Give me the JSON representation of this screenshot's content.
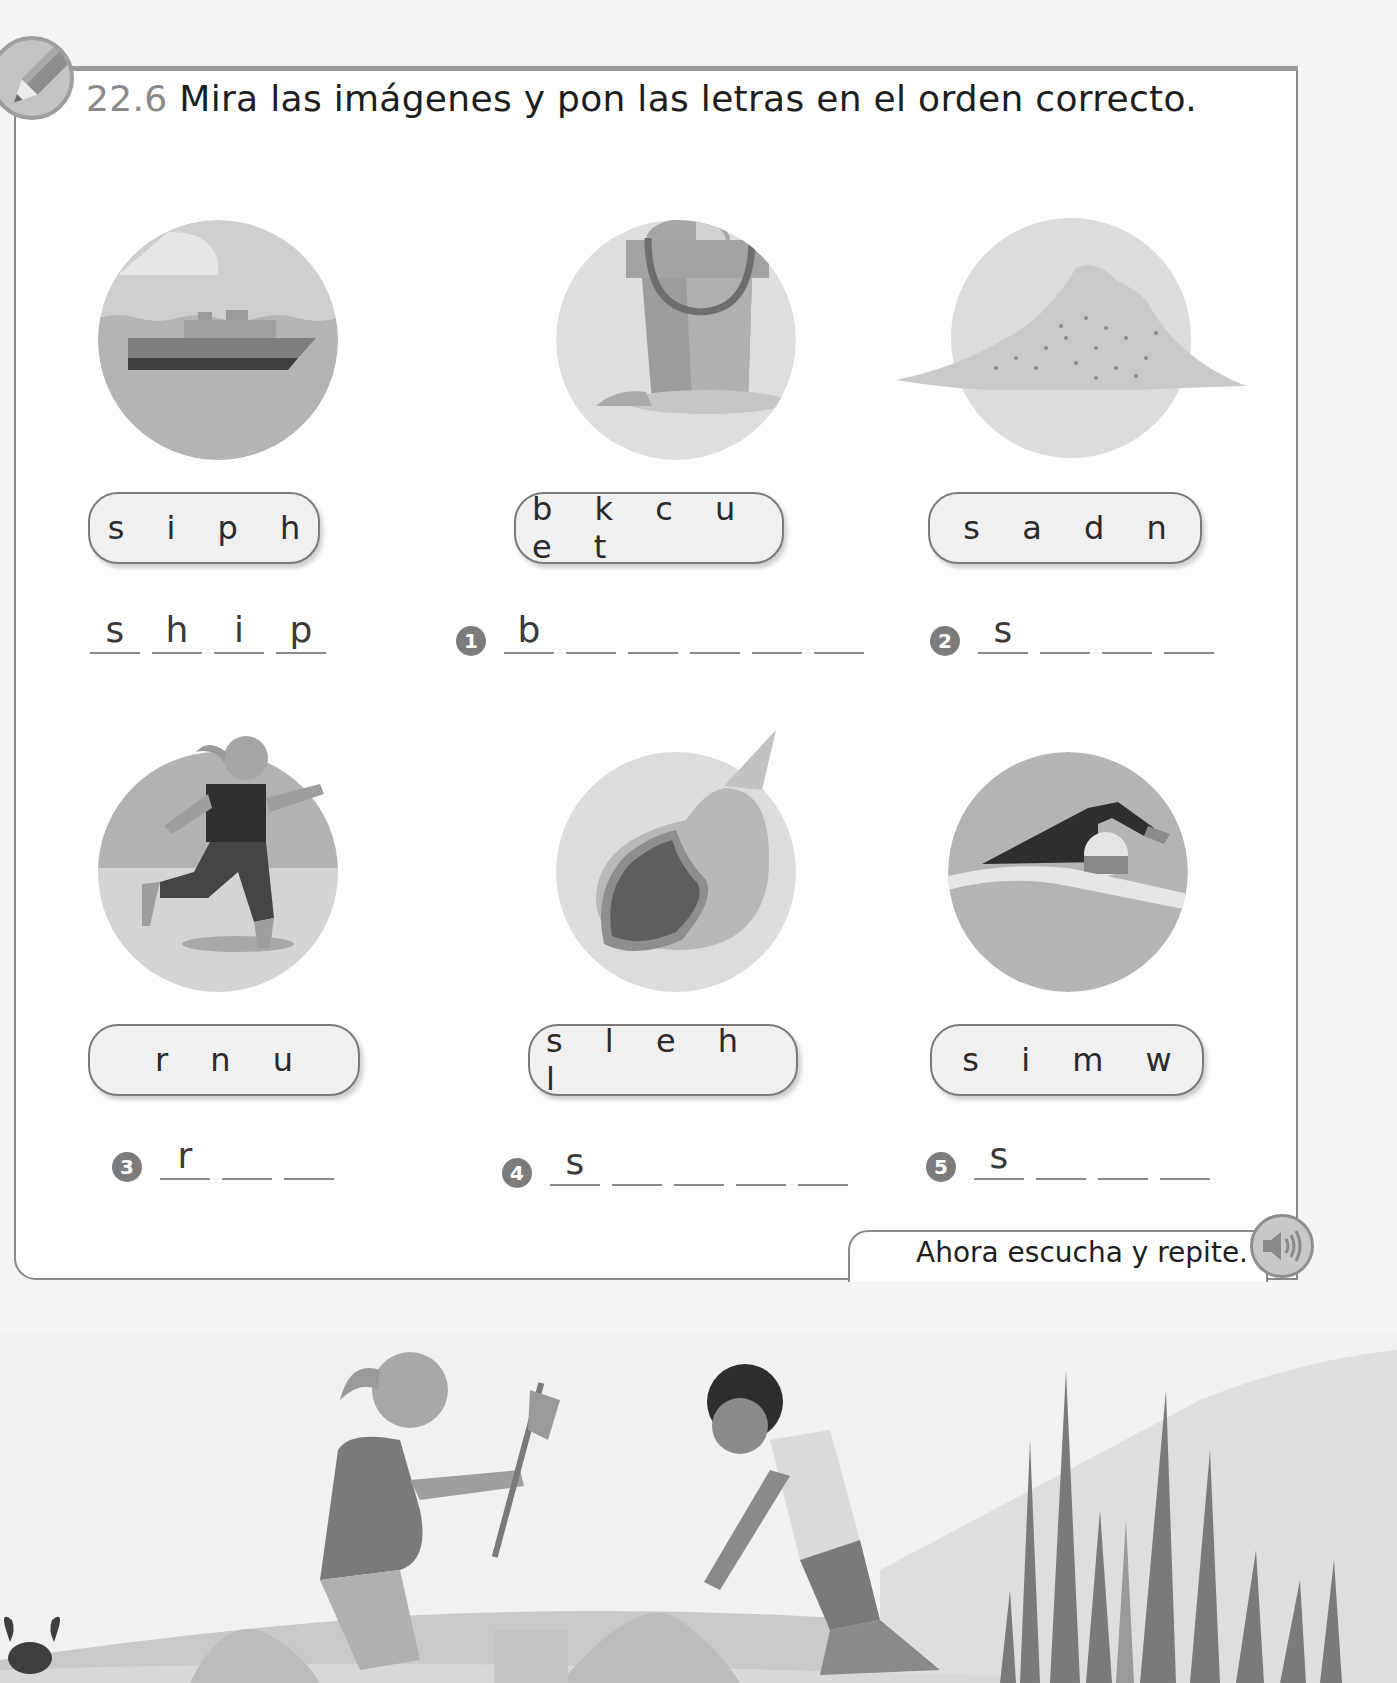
{
  "exercise": {
    "number": "22.6",
    "instruction": "Mira las imágenes y pon las letras en el orden correcto."
  },
  "items": [
    {
      "id": "example",
      "badge": "",
      "picture": "ship",
      "scrambled": "s i p h",
      "answer_letters": [
        "s",
        "h",
        "i",
        "p"
      ]
    },
    {
      "id": "1",
      "badge": "1",
      "picture": "bucket",
      "scrambled": "b k c u e t",
      "answer_letters": [
        "b",
        "",
        "",
        "",
        "",
        ""
      ]
    },
    {
      "id": "2",
      "badge": "2",
      "picture": "sand",
      "scrambled": "s a d n",
      "answer_letters": [
        "s",
        "",
        "",
        ""
      ]
    },
    {
      "id": "3",
      "badge": "3",
      "picture": "run",
      "scrambled": "r n u",
      "answer_letters": [
        "r",
        "",
        ""
      ]
    },
    {
      "id": "4",
      "badge": "4",
      "picture": "shell",
      "scrambled": "s l e h l",
      "answer_letters": [
        "s",
        "",
        "",
        "",
        ""
      ]
    },
    {
      "id": "5",
      "badge": "5",
      "picture": "swim",
      "scrambled": "s i m w",
      "answer_letters": [
        "s",
        "",
        "",
        ""
      ]
    }
  ],
  "footer": {
    "prompt": "Ahora escucha y repite.",
    "audio_icon": "speaker-icon"
  },
  "colors": {
    "frame": "#8a8a8a",
    "badge": "#7c7c7c",
    "pill_bg": "#f0f0f0"
  }
}
